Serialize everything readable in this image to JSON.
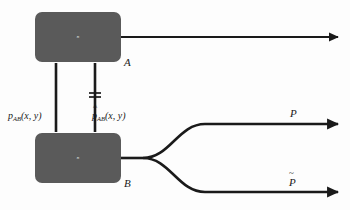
{
  "diagram": {
    "background_color": "#fdfdfd",
    "ink_color": "#1a1a1a",
    "node_fill_color": "#5a5a5a",
    "nodes": [
      {
        "id": "A",
        "inner_label": "n",
        "outer_label": "A",
        "x": 35,
        "y": 12,
        "width": 86,
        "height": 50
      },
      {
        "id": "B",
        "inner_label": "n",
        "outer_label": "B",
        "x": 35,
        "y": 133,
        "width": 86,
        "height": 50
      }
    ],
    "connectors": [
      {
        "id": "left-link",
        "label_base": "p",
        "label_sub": "AB",
        "label_args": "(x, y)",
        "accent": "none",
        "has_break_mark": false
      },
      {
        "id": "right-link",
        "label_base": "p",
        "label_sub": "AB",
        "label_args": "(x, y)",
        "accent": "hat",
        "has_break_mark": true
      }
    ],
    "outputs": [
      {
        "id": "output-top",
        "label": "",
        "accent": "none",
        "from": "A"
      },
      {
        "id": "output-p",
        "label": "P",
        "accent": "none",
        "from": "B"
      },
      {
        "id": "output-p-tilde",
        "label": "P",
        "accent": "tilde",
        "from": "B"
      }
    ]
  }
}
